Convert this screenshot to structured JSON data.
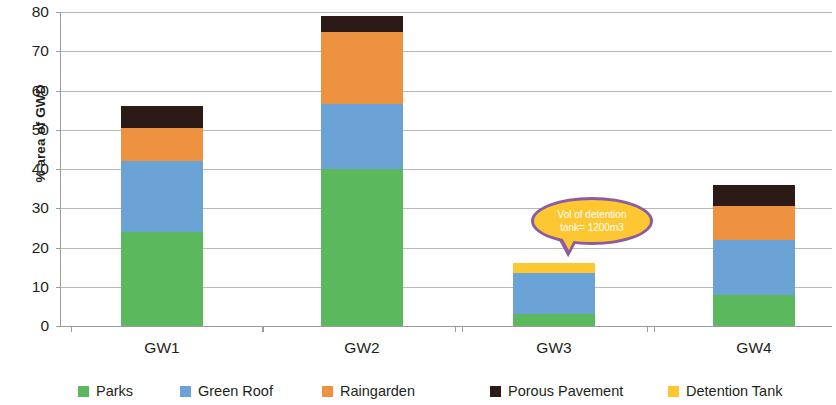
{
  "chart_data": {
    "type": "bar",
    "stacked": true,
    "title": "",
    "xlabel": "",
    "ylabel": "% area of GWD",
    "ylim": [
      0,
      80
    ],
    "yticks": [
      0,
      10,
      20,
      30,
      40,
      50,
      60,
      70,
      80
    ],
    "grid": true,
    "legend_position": "bottom",
    "categories": [
      "GW1",
      "GW2",
      "GW3",
      "GW4"
    ],
    "series": [
      {
        "name": "Parks",
        "color": "#5cb85c",
        "values": [
          24,
          40,
          3,
          8
        ]
      },
      {
        "name": "Green Roof",
        "color": "#6ba3d6",
        "values": [
          18,
          16.5,
          10.5,
          14
        ]
      },
      {
        "name": "Raingarden",
        "color": "#ed9240",
        "values": [
          8.5,
          18.5,
          0,
          8.5
        ]
      },
      {
        "name": "Porous Pavement",
        "color": "#2b1a15",
        "values": [
          5.5,
          4,
          0,
          5.5
        ]
      },
      {
        "name": "Detention Tank",
        "color": "#fcc731",
        "values": [
          0,
          0,
          2.5,
          0
        ]
      }
    ],
    "totals": [
      56,
      79,
      16,
      36
    ],
    "annotations": [
      {
        "name": "detention-tank-callout",
        "line1": "Vol of detention",
        "line2": "tank= 1200m3",
        "fill": "#fcc731",
        "stroke": "#8c5ca0",
        "text_color": "#ffffff"
      }
    ]
  },
  "axes": {
    "y_title": "% area of GWD",
    "y_tick_labels": [
      "0",
      "10",
      "20",
      "30",
      "40",
      "50",
      "60",
      "70",
      "80"
    ],
    "x_tick_labels": [
      "GW1",
      "GW2",
      "GW3",
      "GW4"
    ]
  },
  "legend": {
    "items": [
      {
        "label": "Parks",
        "color": "#5cb85c"
      },
      {
        "label": "Green Roof",
        "color": "#6ba3d6"
      },
      {
        "label": "Raingarden",
        "color": "#ed9240"
      },
      {
        "label": "Porous Pavement",
        "color": "#2b1a15"
      },
      {
        "label": "Detention Tank",
        "color": "#fcc731"
      }
    ]
  },
  "callout": {
    "line1": "Vol of detention",
    "line2": "tank= 1200m3"
  }
}
